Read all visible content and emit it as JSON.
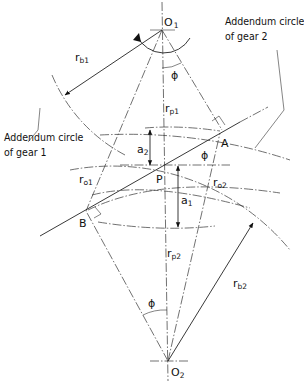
{
  "diagram": {
    "annotations": {
      "addendum_gear2_line1": "Addendum circle",
      "addendum_gear2_line2": "of gear 2",
      "addendum_gear1_line1": "Addendum circle",
      "addendum_gear1_line2": "of gear 1"
    },
    "points": {
      "O1": {
        "label": "O",
        "sub": "1"
      },
      "O2": {
        "label": "O",
        "sub": "2"
      },
      "P": {
        "label": "P"
      },
      "A": {
        "label": "A"
      },
      "B": {
        "label": "B"
      }
    },
    "dimensions": {
      "rb1": {
        "label": "r",
        "sub": "b1"
      },
      "rb2": {
        "label": "r",
        "sub": "b2"
      },
      "rp1": {
        "label": "r",
        "sub": "p1"
      },
      "rp2": {
        "label": "r",
        "sub": "p2"
      },
      "ro1": {
        "label": "r",
        "sub": "o1"
      },
      "ro2": {
        "label": "r",
        "sub": "o2"
      },
      "a1": {
        "label": "a",
        "sub": "1"
      },
      "a2": {
        "label": "a",
        "sub": "2"
      }
    },
    "angles": {
      "phi_top": "ϕ",
      "phi_mid": "ϕ",
      "phi_bottom": "ϕ"
    },
    "colors": {
      "line": "#222222",
      "background": "#ffffff"
    }
  }
}
